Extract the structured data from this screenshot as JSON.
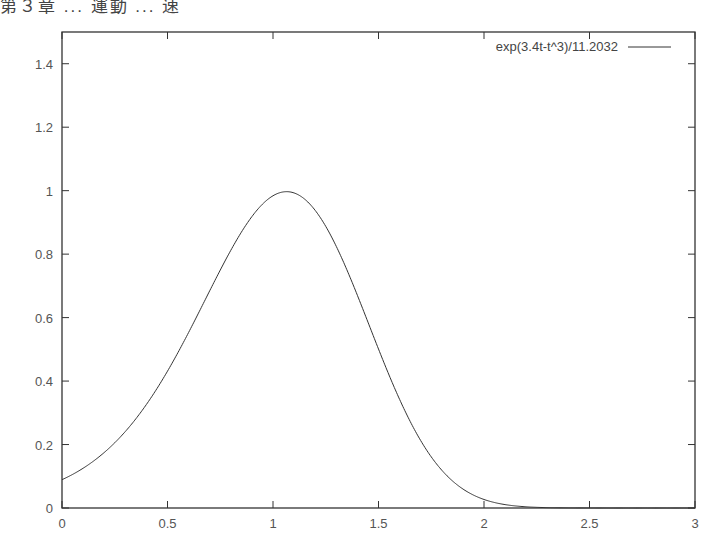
{
  "header": {
    "partial_text": "第３章 ... 運動 ... 速"
  },
  "chart_data": {
    "type": "line",
    "title": "",
    "xlabel": "",
    "ylabel": "",
    "xlim": [
      0,
      3
    ],
    "ylim": [
      0,
      1.5
    ],
    "grid": false,
    "legend_position": "top-right-inside",
    "x_ticks": [
      "0",
      "0.5",
      "1",
      "1.5",
      "2",
      "2.5",
      "3"
    ],
    "y_ticks": [
      "0",
      "0.2",
      "0.4",
      "0.6",
      "0.8",
      "1",
      "1.2",
      "1.4"
    ],
    "series": [
      {
        "name": "exp(3.4t-t^3)/11.2032",
        "formula": "exp(3.4*t - t^3)/11.2032",
        "color": "#333333",
        "x": [
          0,
          0.1,
          0.2,
          0.3,
          0.4,
          0.5,
          0.6,
          0.7,
          0.8,
          0.9,
          1.0,
          1.0646,
          1.1,
          1.2,
          1.3,
          1.4,
          1.5,
          1.6,
          1.7,
          1.8,
          1.9,
          2.0,
          2.1,
          2.2,
          2.3,
          2.5,
          3.0
        ],
        "y": [
          0.089,
          0.125,
          0.175,
          0.243,
          0.333,
          0.446,
          0.581,
          0.729,
          0.87,
          0.973,
          0.997,
          0.997,
          0.995,
          0.961,
          0.863,
          0.705,
          0.511,
          0.318,
          0.165,
          0.069,
          0.022,
          0.005,
          0.0008,
          0.0001,
          0.0,
          0.0,
          0.0
        ]
      }
    ]
  },
  "legend": {
    "label": "exp(3.4t-t^3)/11.2032"
  }
}
